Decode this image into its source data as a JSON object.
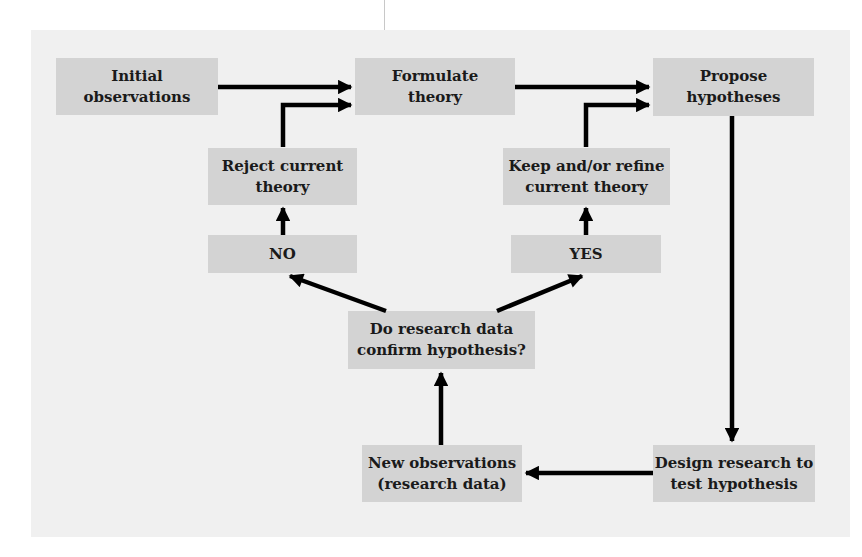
{
  "diagram": {
    "type": "flowchart",
    "colors": {
      "panel": "#f0f0f0",
      "box": "#d3d3d3",
      "arrow": "#000000",
      "text": "#1a1a1a"
    },
    "nodes": {
      "initial_observations": "Initial\nobservations",
      "formulate_theory": "Formulate\ntheory",
      "propose_hypotheses": "Propose\nhypotheses",
      "reject_current_theory": "Reject current\ntheory",
      "keep_refine_theory": "Keep and/or refine\ncurrent theory",
      "no": "NO",
      "yes": "YES",
      "confirm_question": "Do research data\nconfirm hypothesis?",
      "new_observations": "New observations\n(research data)",
      "design_research": "Design research to\ntest hypothesis"
    },
    "edges": [
      {
        "from": "Initial observations",
        "to": "Formulate theory"
      },
      {
        "from": "Reject current theory",
        "to": "Formulate theory"
      },
      {
        "from": "Formulate theory",
        "to": "Propose hypotheses"
      },
      {
        "from": "Keep and/or refine current theory",
        "to": "Propose hypotheses"
      },
      {
        "from": "Propose hypotheses",
        "to": "Design research to test hypothesis"
      },
      {
        "from": "Design research to test hypothesis",
        "to": "New observations (research data)"
      },
      {
        "from": "New observations (research data)",
        "to": "Do research data confirm hypothesis?"
      },
      {
        "from": "Do research data confirm hypothesis?",
        "to": "NO"
      },
      {
        "from": "Do research data confirm hypothesis?",
        "to": "YES"
      },
      {
        "from": "NO",
        "to": "Reject current theory"
      },
      {
        "from": "YES",
        "to": "Keep and/or refine current theory"
      }
    ]
  }
}
